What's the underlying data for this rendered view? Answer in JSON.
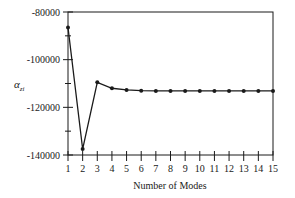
{
  "chart_data": {
    "type": "line",
    "title": "",
    "xlabel": "Number of Modes",
    "ylabel": "α",
    "ylabel_subscript": "zi",
    "x": [
      1,
      2,
      3,
      4,
      5,
      6,
      7,
      8,
      9,
      10,
      11,
      12,
      13,
      14,
      15
    ],
    "series": [
      {
        "name": "α_zi",
        "values": [
          -86500,
          -137500,
          -109500,
          -112000,
          -112700,
          -113000,
          -113100,
          -113100,
          -113100,
          -113100,
          -113100,
          -113100,
          -113100,
          -113100,
          -113100
        ]
      }
    ],
    "xlim": [
      1,
      15
    ],
    "ylim": [
      -140000,
      -80000
    ],
    "x_ticks": [
      "1",
      "2",
      "3",
      "4",
      "5",
      "6",
      "7",
      "8",
      "9",
      "10",
      "11",
      "12",
      "13",
      "14",
      "15"
    ],
    "y_ticks": [
      "-80000",
      "-100000",
      "-120000",
      "-140000"
    ],
    "grid": false,
    "legend": "none",
    "marker": "circle",
    "line_color": "#1a1a1a"
  }
}
